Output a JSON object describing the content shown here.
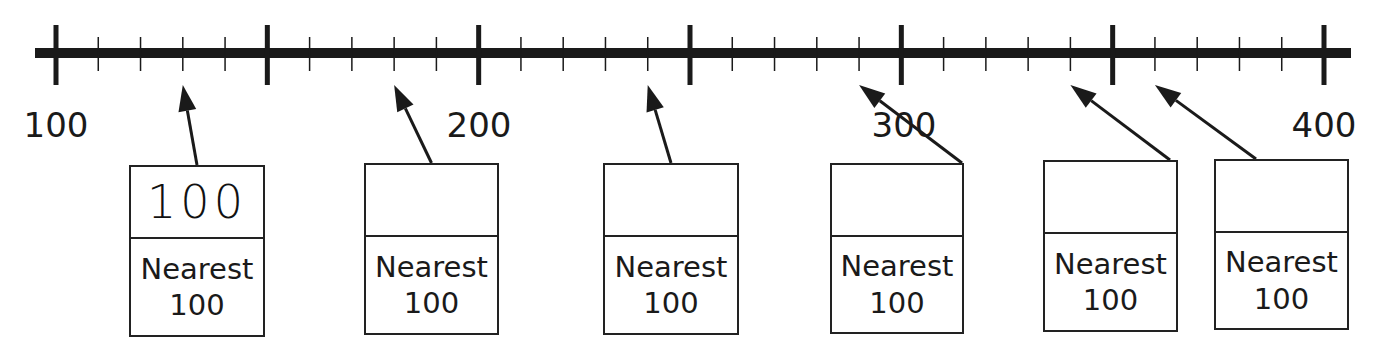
{
  "worksheet": {
    "task": "Round to the nearest 100",
    "number_line": {
      "start": 100,
      "end": 400,
      "major_tick_step": 50,
      "minor_tick_step": 10,
      "labels": [
        {
          "value": 100,
          "text": "100"
        },
        {
          "value": 200,
          "text": "200"
        },
        {
          "value": 300,
          "text": "300"
        },
        {
          "value": 400,
          "text": "400"
        }
      ]
    },
    "boxes": [
      {
        "points_to": 130,
        "answer": "100",
        "caption_line1": "Nearest",
        "caption_line2": "100"
      },
      {
        "points_to": 180,
        "answer": "",
        "caption_line1": "Nearest",
        "caption_line2": "100"
      },
      {
        "points_to": 240,
        "answer": "",
        "caption_line1": "Nearest",
        "caption_line2": "100"
      },
      {
        "points_to": 290,
        "answer": "",
        "caption_line1": "Nearest",
        "caption_line2": "100"
      },
      {
        "points_to": 340,
        "answer": "",
        "caption_line1": "Nearest",
        "caption_line2": "100"
      },
      {
        "points_to": 360,
        "answer": "",
        "caption_line1": "Nearest",
        "caption_line2": "100"
      }
    ],
    "colors": {
      "ink": "#1a1a1a",
      "background": "#ffffff"
    }
  }
}
